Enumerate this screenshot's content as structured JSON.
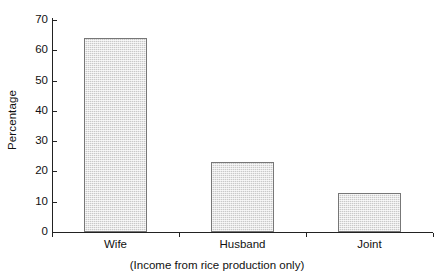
{
  "chart_data": {
    "type": "bar",
    "title": "",
    "subtitle": "(Income from rice production only)",
    "xlabel": "",
    "ylabel": "Percentage",
    "categories": [
      "Wife",
      "Husband",
      "Joint"
    ],
    "values": [
      64,
      23,
      13
    ],
    "ylim": [
      0,
      70
    ],
    "ytick_labels": [
      "70",
      "60",
      "50",
      "40",
      "30",
      "20",
      "10",
      "0"
    ],
    "ytick_values": [
      70,
      60,
      50,
      40,
      30,
      20,
      10,
      0
    ],
    "grid": false,
    "legend": "none",
    "bar_fill_color": "#c9c9c9",
    "bar_border_color": "#777777",
    "axis_color": "#222222",
    "text_color": "#111111",
    "background_color": "#ffffff"
  },
  "axes": {
    "y_title": "Percentage",
    "caption": "(Income from rice production only)"
  }
}
